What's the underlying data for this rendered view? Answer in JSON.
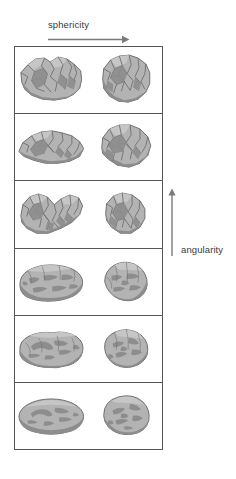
{
  "figure": {
    "title_top": "sphericity",
    "title_right": "angularity",
    "axes": {
      "horizontal": {
        "label": "sphericity",
        "direction": "left-to-right",
        "meaning": "sphericity increases to the right",
        "arrow_icon": "right-arrow-icon"
      },
      "vertical": {
        "label": "angularity",
        "direction": "bottom-to-top",
        "meaning": "angularity increases upward",
        "arrow_icon": "up-arrow-icon"
      }
    },
    "colors": {
      "grain_fill": "#b3b3b3",
      "grain_shadow": "#8d8d8d",
      "grain_highlight": "#c9c9c9",
      "grain_outline": "#6e6e6e",
      "box_border": "#555555",
      "label_text": "#3a3a3a",
      "arrow": "#7a7a7a",
      "background": "#ffffff"
    },
    "grid": {
      "rows": 6,
      "columns": 2,
      "column_headers": [
        "low sphericity",
        "high sphericity"
      ],
      "row_order": "most angular at top, most rounded at bottom"
    },
    "rows": [
      {
        "index": 1,
        "roundness_class": "very angular",
        "cells": [
          {
            "column": "low-sphericity",
            "grain_name": "very-angular-low-sphericity-grain"
          },
          {
            "column": "high-sphericity",
            "grain_name": "very-angular-high-sphericity-grain"
          }
        ]
      },
      {
        "index": 2,
        "roundness_class": "angular",
        "cells": [
          {
            "column": "low-sphericity",
            "grain_name": "angular-low-sphericity-grain"
          },
          {
            "column": "high-sphericity",
            "grain_name": "angular-high-sphericity-grain"
          }
        ]
      },
      {
        "index": 3,
        "roundness_class": "sub-angular",
        "cells": [
          {
            "column": "low-sphericity",
            "grain_name": "sub-angular-low-sphericity-grain"
          },
          {
            "column": "high-sphericity",
            "grain_name": "sub-angular-high-sphericity-grain"
          }
        ]
      },
      {
        "index": 4,
        "roundness_class": "sub-rounded",
        "cells": [
          {
            "column": "low-sphericity",
            "grain_name": "sub-rounded-low-sphericity-grain"
          },
          {
            "column": "high-sphericity",
            "grain_name": "sub-rounded-high-sphericity-grain"
          }
        ]
      },
      {
        "index": 5,
        "roundness_class": "rounded",
        "cells": [
          {
            "column": "low-sphericity",
            "grain_name": "rounded-low-sphericity-grain"
          },
          {
            "column": "high-sphericity",
            "grain_name": "rounded-high-sphericity-grain"
          }
        ]
      },
      {
        "index": 6,
        "roundness_class": "well rounded",
        "cells": [
          {
            "column": "low-sphericity",
            "grain_name": "well-rounded-low-sphericity-grain"
          },
          {
            "column": "high-sphericity",
            "grain_name": "well-rounded-high-sphericity-grain"
          }
        ]
      }
    ]
  }
}
